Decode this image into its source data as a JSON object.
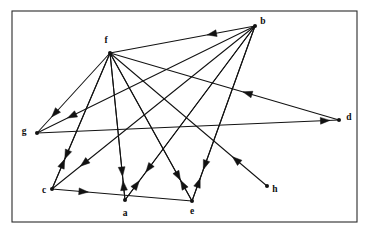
{
  "figure": {
    "type": "directed-graph",
    "title": "",
    "background_color": "#ffffff",
    "frame": {
      "x": 12,
      "y": 11,
      "width": 345,
      "height": 211,
      "stroke_color": "#2b2b2b"
    },
    "edge_color": "#121212",
    "node_color": "#121212"
  },
  "chart_data": {
    "type": "diagram",
    "subtype": "directed-graph",
    "node_count": 8,
    "edge_count": 17,
    "nodes": [
      {
        "id": "a",
        "label": "a",
        "x": 125,
        "y": 200,
        "label_x": 125,
        "label_y": 214
      },
      {
        "id": "b",
        "label": "b",
        "x": 255,
        "y": 26,
        "label_x": 263,
        "label_y": 22
      },
      {
        "id": "c",
        "label": "c",
        "x": 52,
        "y": 189,
        "label_x": 44,
        "label_y": 191
      },
      {
        "id": "d",
        "label": "d",
        "x": 339,
        "y": 120,
        "label_x": 349,
        "label_y": 118
      },
      {
        "id": "e",
        "label": "e",
        "x": 192,
        "y": 201,
        "label_x": 192,
        "label_y": 212
      },
      {
        "id": "f",
        "label": "f",
        "x": 110,
        "y": 53,
        "label_x": 106,
        "label_y": 41
      },
      {
        "id": "g",
        "label": "g",
        "x": 37,
        "y": 133,
        "label_x": 24,
        "label_y": 132
      },
      {
        "id": "h",
        "label": "h",
        "x": 267,
        "y": 186,
        "label_x": 275,
        "label_y": 190
      }
    ],
    "edges": [
      {
        "from": "b",
        "to": "f",
        "head_t": 0.33
      },
      {
        "from": "b",
        "to": "g",
        "head_t": 0.86
      },
      {
        "from": "b",
        "to": "c",
        "head_t": 0.86
      },
      {
        "from": "b",
        "to": "a",
        "head_t": 0.84
      },
      {
        "from": "b",
        "to": "e",
        "head_t": 0.82
      },
      {
        "from": "d",
        "to": "f",
        "head_t": 0.42
      },
      {
        "from": "g",
        "to": "d",
        "head_t": 0.97
      },
      {
        "from": "f",
        "to": "g",
        "head_t": 0.8
      },
      {
        "from": "f",
        "to": "c",
        "head_t": 0.78
      },
      {
        "from": "f",
        "to": "a",
        "head_t": 0.84
      },
      {
        "from": "f",
        "to": "e",
        "head_t": 0.86
      },
      {
        "from": "c",
        "to": "f",
        "head_t": 0.22
      },
      {
        "from": "c",
        "to": "e",
        "head_t": 0.26
      },
      {
        "from": "a",
        "to": "f",
        "head_t": 0.13
      },
      {
        "from": "a",
        "to": "b",
        "head_t": 0.11
      },
      {
        "from": "e",
        "to": "f",
        "head_t": 0.14
      },
      {
        "from": "e",
        "to": "b",
        "head_t": 0.13
      },
      {
        "from": "h",
        "to": "f",
        "head_t": 0.22
      }
    ]
  }
}
